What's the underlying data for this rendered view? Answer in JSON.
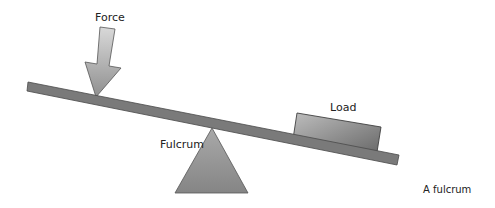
{
  "diagram": {
    "labels": {
      "force": "Force",
      "load": "Load",
      "fulcrum": "Fulcrum"
    },
    "caption": "A fulcrum",
    "colors": {
      "beam": "#7a7a7a",
      "beam_stroke": "#4a4a4a",
      "arrow_light": "#d6d6d6",
      "arrow_dark": "#8c8c8c",
      "load_light": "#b8b8b8",
      "load_dark": "#6e6e6e",
      "fulcrum_light": "#b0b0b0",
      "fulcrum_dark": "#7c7c7c",
      "text": "#222222",
      "background": "#ffffff"
    }
  }
}
